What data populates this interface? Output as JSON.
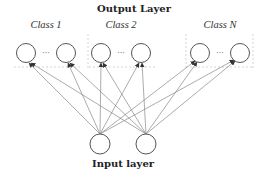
{
  "diagram": {
    "output_title": "Output Layer",
    "input_title": "Input layer",
    "classes": [
      {
        "label": "Class 1",
        "label_x": 40,
        "nodes": [
          {
            "cx": 26,
            "cy": 53
          },
          {
            "cx": 66,
            "cy": 53
          }
        ]
      },
      {
        "label": "Class 2",
        "label_x": 122,
        "nodes": [
          {
            "cx": 101,
            "cy": 53
          },
          {
            "cx": 141,
            "cy": 53
          }
        ]
      },
      {
        "label": "Class N",
        "label_x": 222,
        "nodes": [
          {
            "cx": 200,
            "cy": 53
          },
          {
            "cx": 240,
            "cy": 53
          }
        ]
      }
    ],
    "ellipsis": "···",
    "input_nodes": [
      {
        "cx": 100,
        "cy": 144
      },
      {
        "cx": 146,
        "cy": 144
      }
    ],
    "colors": {
      "node_stroke": "#555555",
      "edge": "#888888",
      "arrow": "#333333"
    }
  }
}
